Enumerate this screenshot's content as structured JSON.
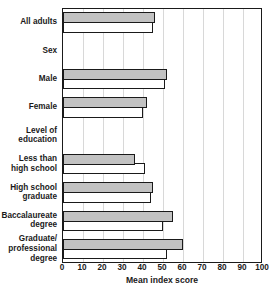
{
  "chart_data": {
    "type": "bar",
    "orientation": "horizontal",
    "title": "",
    "xlabel": "Mean index score",
    "ylabel": "",
    "xlim": [
      0,
      100
    ],
    "xticks": [
      0,
      10,
      20,
      30,
      40,
      50,
      60,
      70,
      80,
      90,
      100
    ],
    "grid": true,
    "legend_position": "none",
    "categories": [
      "All adults",
      "Sex",
      "Male",
      "Female",
      "Level of\neducation",
      "Less than\nhigh school",
      "High school\ngraduate",
      "Baccalaureate\ndegree",
      "Graduate/\nprofessional\ndegree"
    ],
    "category_is_header": [
      false,
      true,
      false,
      false,
      true,
      false,
      false,
      false,
      false
    ],
    "series": [
      {
        "name": "Shaded",
        "style": "shaded",
        "color": "#c2c2c2",
        "values": [
          46,
          null,
          52,
          42,
          null,
          36,
          45,
          55,
          60
        ]
      },
      {
        "name": "Open",
        "style": "open",
        "color": "#ffffff",
        "values": [
          45,
          null,
          51,
          40,
          null,
          41,
          44,
          50,
          52
        ]
      }
    ]
  },
  "colors": {
    "shaded_fill": "#c2c2c2",
    "open_fill": "#ffffff",
    "outline": "#1a1a1a",
    "gridline": "#d8d8d8",
    "background": "#ffffff"
  }
}
